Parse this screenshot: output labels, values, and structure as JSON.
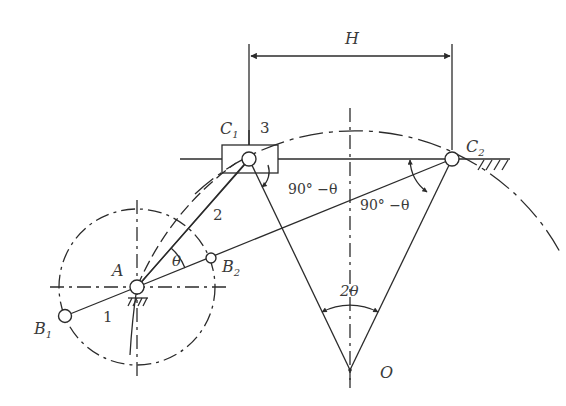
{
  "diagram": {
    "labels": {
      "stroke": "H",
      "slider_left": "C",
      "slider_left_sub": "1",
      "slider_right": "C",
      "slider_right_sub": "2",
      "slider_number": "3",
      "coupler_number": "2",
      "crank_number": "1",
      "pivot": "A",
      "crank_end_1": "B",
      "crank_end_1_sub": "1",
      "crank_end_2": "B",
      "crank_end_2_sub": "2",
      "theta": "θ",
      "angle_left": "90° −θ",
      "angle_right": "90° −θ",
      "center_angle": "2θ",
      "center": "O"
    },
    "points": {
      "A": [
        137,
        287
      ],
      "B1": [
        65,
        316
      ],
      "B2": [
        211,
        258
      ],
      "C1": [
        249,
        159
      ],
      "C2": [
        452,
        159
      ],
      "O": [
        350,
        370
      ]
    },
    "crank_circle_radius": 78,
    "arc_radius": 234,
    "line_color": "#2b2b2b"
  }
}
